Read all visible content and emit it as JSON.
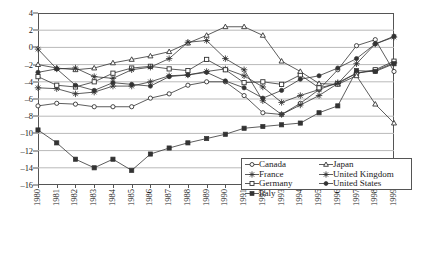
{
  "chart_data": {
    "type": "line",
    "title": "",
    "subtitle": "",
    "xlabel": "",
    "ylabel": "",
    "grid": true,
    "grid_axis": "y",
    "legend_position": "inside-bottom-right",
    "x": [
      "1980",
      "1981",
      "1982",
      "1983",
      "1984",
      "1985",
      "1986",
      "1987",
      "1988",
      "1989",
      "1990",
      "1991",
      "1992",
      "1993",
      "1994",
      "1995",
      "1996",
      "1997",
      "1998",
      "1999"
    ],
    "xlim": [
      "1980",
      "1999"
    ],
    "ylim": [
      -16,
      4
    ],
    "yticks": [
      4,
      2,
      0,
      -2,
      -4,
      -6,
      -8,
      -10,
      -12,
      -14,
      -16
    ],
    "ytick_labels": [
      "4",
      "2",
      "0",
      "–2",
      "–4",
      "–6",
      "–8",
      "–10",
      "–12",
      "–14",
      "–16"
    ],
    "series": [
      {
        "name": "Canada",
        "marker": "open-circle",
        "color": "#333333",
        "values": [
          -6.8,
          -6.5,
          -6.6,
          -6.9,
          -6.9,
          -6.9,
          -5.9,
          -5.4,
          -4.4,
          -4.0,
          -4.0,
          -5.6,
          -7.6,
          -7.8,
          -6.5,
          -4.9,
          -2.6,
          0.2,
          0.9,
          -2.8
        ]
      },
      {
        "name": "France",
        "marker": "star",
        "color": "#333333",
        "values": [
          -4.7,
          -4.8,
          -5.4,
          -5.2,
          -4.5,
          -4.5,
          -4.0,
          -3.3,
          -3.2,
          -2.8,
          -2.5,
          -3.3,
          -4.6,
          -6.4,
          -5.6,
          -4.9,
          -4.1,
          -3.0,
          -2.7,
          -1.8
        ]
      },
      {
        "name": "Germany",
        "marker": "open-square",
        "color": "#333333",
        "values": [
          -3.4,
          -4.4,
          -4.6,
          -4.0,
          -3.0,
          -2.4,
          -2.2,
          -2.5,
          -2.7,
          -1.4,
          -2.6,
          -4.1,
          -4.0,
          -4.3,
          -3.2,
          -4.7,
          -4.2,
          -3.0,
          -2.6,
          -1.6
        ]
      },
      {
        "name": "Italy",
        "marker": "filled-square",
        "color": "#333333",
        "values": [
          -9.6,
          -11.1,
          -13.0,
          -14.0,
          -13.0,
          -14.3,
          -12.4,
          -11.7,
          -11.1,
          -10.6,
          -10.1,
          -9.4,
          -9.2,
          -9.0,
          -8.8,
          -7.6,
          -6.8,
          -2.7,
          -2.8,
          -1.9
        ]
      },
      {
        "name": "Japan",
        "marker": "open-triangle",
        "color": "#333333",
        "values": [
          -2.0,
          -2.4,
          -2.6,
          -2.4,
          -1.8,
          -1.4,
          -1.0,
          -0.5,
          0.5,
          1.4,
          2.4,
          2.4,
          1.4,
          -1.6,
          -2.8,
          -4.2,
          -4.3,
          -3.3,
          -6.6,
          -8.8
        ]
      },
      {
        "name": "United Kingdom",
        "marker": "filled-star",
        "color": "#333333",
        "values": [
          -0.2,
          -2.5,
          -2.4,
          -3.4,
          -3.6,
          -2.6,
          -2.3,
          -1.3,
          0.6,
          0.8,
          -1.3,
          -2.6,
          -6.2,
          -7.8,
          -6.7,
          -5.6,
          -4.2,
          -1.9,
          0.4,
          1.2
        ]
      },
      {
        "name": "United States",
        "marker": "filled-circle",
        "color": "#333333",
        "values": [
          -2.9,
          -2.5,
          -4.4,
          -5.0,
          -4.1,
          -4.3,
          -4.5,
          -3.4,
          -3.2,
          -2.9,
          -3.9,
          -4.7,
          -5.9,
          -5.0,
          -3.7,
          -3.3,
          -2.4,
          -1.3,
          0.4,
          1.3
        ]
      }
    ]
  },
  "legend": {
    "column_1": [
      "Canada",
      "France",
      "Germany",
      "Italy"
    ],
    "column_2": [
      "Japan",
      "United Kingdom",
      "United States"
    ]
  }
}
